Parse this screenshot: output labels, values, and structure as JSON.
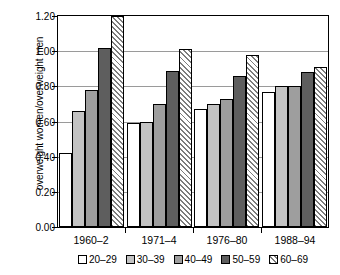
{
  "chart_data": {
    "type": "bar",
    "title": "",
    "xlabel": "",
    "ylabel": "overweight women/overweight men",
    "ylim": [
      0.0,
      1.2
    ],
    "ytick_labels": [
      "0.00",
      "0.20",
      "0.40",
      "0.60",
      "0.80",
      "1.00",
      "1.20"
    ],
    "ytick_values": [
      0.0,
      0.2,
      0.4,
      0.6,
      0.8,
      1.0,
      1.2
    ],
    "grid": true,
    "legend_position": "bottom",
    "categories": [
      "1960–2",
      "1971–4",
      "1976–80",
      "1988–94"
    ],
    "series": [
      {
        "name": "20–29",
        "values": [
          0.42,
          0.59,
          0.67,
          0.77
        ]
      },
      {
        "name": "30–39",
        "values": [
          0.66,
          0.6,
          0.7,
          0.8
        ]
      },
      {
        "name": "40–49",
        "values": [
          0.78,
          0.7,
          0.73,
          0.8
        ]
      },
      {
        "name": "50–59",
        "values": [
          1.02,
          0.89,
          0.86,
          0.88
        ]
      },
      {
        "name": "60–69",
        "values": [
          1.2,
          1.01,
          0.98,
          0.91
        ]
      }
    ]
  },
  "colors": {
    "series_20_29": "#ffffff",
    "series_30_39": "#c3c3c3",
    "series_40_49": "#9e9e9e",
    "series_50_59": "#5e5e5e",
    "series_60_69": "#ffffff",
    "hatch": "#7d7d7d",
    "axis": "#000000",
    "gridline": "#9a9a9a",
    "background": "#ffffff"
  }
}
